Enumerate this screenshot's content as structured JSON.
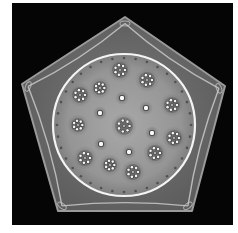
{
  "image": {
    "subject": "micrograph of pentagonal specimen with circular central plate bearing rosette patterns",
    "background_color": "#050505",
    "pentagon": {
      "fill": "#6e6e6e",
      "edge_highlight": "#d8d8d8",
      "vertices": [
        [
          125,
          17
        ],
        [
          225,
          86
        ],
        [
          192,
          211
        ],
        [
          58,
          211
        ],
        [
          22,
          84
        ]
      ]
    },
    "disc": {
      "cx": 124,
      "cy": 125,
      "r": 71,
      "fill": "#9a9a9a",
      "rim_color": "#f4f4f4"
    },
    "rosettes": [
      {
        "cx": 124,
        "cy": 126,
        "r": 9
      },
      {
        "cx": 120,
        "cy": 70,
        "r": 8
      },
      {
        "cx": 147,
        "cy": 80,
        "r": 8
      },
      {
        "cx": 100,
        "cy": 88,
        "r": 7
      },
      {
        "cx": 80,
        "cy": 95,
        "r": 8
      },
      {
        "cx": 172,
        "cy": 105,
        "r": 8
      },
      {
        "cx": 78,
        "cy": 125,
        "r": 7
      },
      {
        "cx": 174,
        "cy": 138,
        "r": 8
      },
      {
        "cx": 155,
        "cy": 153,
        "r": 8
      },
      {
        "cx": 85,
        "cy": 158,
        "r": 8
      },
      {
        "cx": 110,
        "cy": 165,
        "r": 7
      },
      {
        "cx": 133,
        "cy": 172,
        "r": 8
      }
    ],
    "spots": [
      {
        "cx": 122,
        "cy": 98
      },
      {
        "cx": 146,
        "cy": 108
      },
      {
        "cx": 100,
        "cy": 113
      },
      {
        "cx": 152,
        "cy": 133
      },
      {
        "cx": 101,
        "cy": 144
      },
      {
        "cx": 129,
        "cy": 152
      }
    ]
  }
}
